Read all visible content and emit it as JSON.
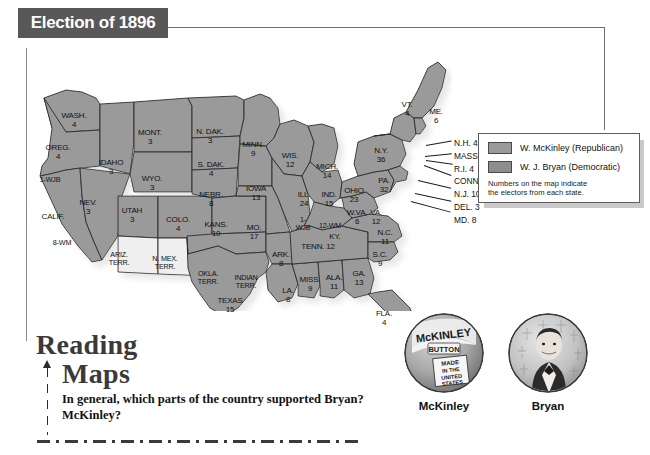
{
  "banner": {
    "title": "Election of 1896"
  },
  "legend": {
    "entries": [
      {
        "label": "W. McKinley (Republican)",
        "color": "#9a9a9a",
        "swatch_name": "republican-swatch"
      },
      {
        "label": "W. J. Bryan (Democratic)",
        "color": "#8d8d8d",
        "swatch_name": "democratic-swatch"
      }
    ],
    "note": "Numbers on the map indicate\nthe electors from each state."
  },
  "map": {
    "state_labels": [
      {
        "name": "washington",
        "text": "WASH.\n4",
        "x": 52,
        "y": 66
      },
      {
        "name": "oregon",
        "text": "OREG.\n4",
        "x": 36,
        "y": 98
      },
      {
        "name": "california-1",
        "text": "1-WJB",
        "x": 28,
        "y": 130
      },
      {
        "name": "california",
        "text": "CALIF.",
        "x": 31,
        "y": 167
      },
      {
        "name": "california-8",
        "text": "8-WM",
        "x": 40,
        "y": 193
      },
      {
        "name": "idaho",
        "text": "IDAHO\n3",
        "x": 89,
        "y": 113
      },
      {
        "name": "nevada",
        "text": "NEV.\n3",
        "x": 66,
        "y": 153
      },
      {
        "name": "utah",
        "text": "UTAH\n3",
        "x": 110,
        "y": 161
      },
      {
        "name": "arizona-terr",
        "text": "ARIZ.\nTERR.",
        "x": 97,
        "y": 205
      },
      {
        "name": "new-mexico-terr",
        "text": "N. MEX.\nTERR.",
        "x": 143,
        "y": 209
      },
      {
        "name": "montana",
        "text": "MONT.\n3",
        "x": 128,
        "y": 83
      },
      {
        "name": "wyoming",
        "text": "WYO.\n3",
        "x": 130,
        "y": 129
      },
      {
        "name": "colorado",
        "text": "COLO.\n4",
        "x": 156,
        "y": 170
      },
      {
        "name": "north-dakota",
        "text": "N. DAK.\n3",
        "x": 188,
        "y": 82
      },
      {
        "name": "south-dakota",
        "text": "S. DAK.\n4",
        "x": 189,
        "y": 115
      },
      {
        "name": "nebraska",
        "text": "NEBR.\n8",
        "x": 189,
        "y": 145
      },
      {
        "name": "kansas",
        "text": "KANS.\n10",
        "x": 194,
        "y": 175
      },
      {
        "name": "oklahoma-terr",
        "text": "OKLA.\nTERR.",
        "x": 186,
        "y": 224
      },
      {
        "name": "indian-terr",
        "text": "INDIAN\nTERR.",
        "x": 224,
        "y": 228
      },
      {
        "name": "texas",
        "text": "TEXAS\n15",
        "x": 208,
        "y": 251
      },
      {
        "name": "minnesota",
        "text": "MINN.\n9",
        "x": 231,
        "y": 95
      },
      {
        "name": "iowa",
        "text": "IOWA\n13",
        "x": 234,
        "y": 139
      },
      {
        "name": "missouri",
        "text": "MO.\n17",
        "x": 232,
        "y": 178
      },
      {
        "name": "arkansas",
        "text": "ARK.\n8",
        "x": 259,
        "y": 205
      },
      {
        "name": "louisiana",
        "text": "LA.\n8",
        "x": 266,
        "y": 241
      },
      {
        "name": "wisconsin",
        "text": "WIS.\n12",
        "x": 268,
        "y": 106
      },
      {
        "name": "illinois",
        "text": "ILL.\n24",
        "x": 282,
        "y": 145
      },
      {
        "name": "illinois-1",
        "text": "1-\nWJB",
        "x": 281,
        "y": 170
      },
      {
        "name": "michigan",
        "text": "MICH.\n14",
        "x": 305,
        "y": 117
      },
      {
        "name": "indiana",
        "text": "IND.\n15",
        "x": 307,
        "y": 145
      },
      {
        "name": "ohio",
        "text": "OHIO\n23",
        "x": 332,
        "y": 141
      },
      {
        "name": "kentucky-12",
        "text": "12-WM",
        "x": 308,
        "y": 176
      },
      {
        "name": "kentucky",
        "text": "KY.",
        "x": 313,
        "y": 187
      },
      {
        "name": "tennessee",
        "text": "TENN. 12",
        "x": 296,
        "y": 197
      },
      {
        "name": "mississippi",
        "text": "MISS.\n9",
        "x": 288,
        "y": 230
      },
      {
        "name": "alabama",
        "text": "ALA.\n11",
        "x": 312,
        "y": 228
      },
      {
        "name": "georgia",
        "text": "GA.\n13",
        "x": 337,
        "y": 224
      },
      {
        "name": "florida",
        "text": "FLA.\n4",
        "x": 362,
        "y": 264
      },
      {
        "name": "south-carolina",
        "text": "S.C.\n9",
        "x": 358,
        "y": 205
      },
      {
        "name": "north-carolina",
        "text": "N.C.\n11",
        "x": 363,
        "y": 183
      },
      {
        "name": "virginia",
        "text": "VA.\n12",
        "x": 354,
        "y": 163
      },
      {
        "name": "west-virginia",
        "text": "W.VA.\n6",
        "x": 335,
        "y": 163
      },
      {
        "name": "pennsylvania",
        "text": "PA.\n32",
        "x": 362,
        "y": 131
      },
      {
        "name": "new-york",
        "text": "N.Y.\n36",
        "x": 359,
        "y": 101
      },
      {
        "name": "vermont",
        "text": "VT.\n4",
        "x": 385,
        "y": 55
      },
      {
        "name": "maine",
        "text": "ME.\n6",
        "x": 414,
        "y": 62
      }
    ],
    "callouts": [
      {
        "name": "new-hampshire",
        "text": "N.H. 4",
        "x": 432,
        "y": 92,
        "lx": 404,
        "ly": 99,
        "len": 26,
        "ang": -10
      },
      {
        "name": "massachusetts",
        "text": "MASS. 15",
        "x": 432,
        "y": 105,
        "lx": 403,
        "ly": 110,
        "len": 27,
        "ang": -6
      },
      {
        "name": "rhode-island",
        "text": "R.I. 4",
        "x": 432,
        "y": 118,
        "lx": 404,
        "ly": 114,
        "len": 27,
        "ang": 8
      },
      {
        "name": "connecticut",
        "text": "CONN. 6",
        "x": 432,
        "y": 130,
        "lx": 402,
        "ly": 119,
        "len": 29,
        "ang": 20
      },
      {
        "name": "new-jersey",
        "text": "N.J. 10",
        "x": 432,
        "y": 143,
        "lx": 396,
        "ly": 134,
        "len": 34,
        "ang": 13
      },
      {
        "name": "delaware",
        "text": "DEL. 3",
        "x": 432,
        "y": 156,
        "lx": 393,
        "ly": 147,
        "len": 37,
        "ang": 12
      },
      {
        "name": "maryland",
        "text": "MD. 8",
        "x": 432,
        "y": 169,
        "lx": 389,
        "ly": 155,
        "len": 41,
        "ang": 15
      }
    ]
  },
  "reading_maps": {
    "heading_line1": "Reading",
    "heading_line2": "Maps",
    "question": "In general, which parts of the country supported Bryan? McKinley?"
  },
  "buttons": [
    {
      "name": "mckinley-button",
      "caption": "McKinley",
      "inscription_top": "McKINLEY",
      "inscription_sub": "BUTTON",
      "inscription_scroll": "MADE\nIN THE\nUNITED\nSTATES"
    },
    {
      "name": "bryan-button",
      "caption": "Bryan",
      "inscription_top": "",
      "inscription_sub": "",
      "inscription_scroll": ""
    }
  ],
  "colors": {
    "banner_bg": "#585858",
    "state_fill": "#9a9a9a",
    "territory_fill": "#efefef",
    "state_stroke": "#2b2b2b",
    "shadow": "#c9c9c9"
  }
}
